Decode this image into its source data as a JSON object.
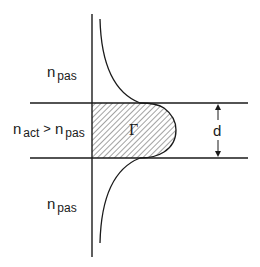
{
  "diagram": {
    "type": "waveguide-mode-confinement",
    "labels": {
      "top_region": {
        "symbol": "n",
        "subscript": "pas"
      },
      "middle_region": {
        "left": {
          "symbol": "n",
          "subscript": "act"
        },
        "relation": ">",
        "right": {
          "symbol": "n",
          "subscript": "pas"
        }
      },
      "bottom_region": {
        "symbol": "n",
        "subscript": "pas"
      },
      "confinement_factor": "Γ",
      "thickness": "d"
    },
    "colors": {
      "line": "#1a1a1a",
      "hatch": "#333333",
      "background": "#ffffff"
    },
    "geometry": {
      "vertical_axis_x": 92,
      "top_boundary_y": 103,
      "bottom_boundary_y": 158,
      "boundary_x_start": 30,
      "boundary_x_end": 248,
      "arrow_x": 218
    }
  }
}
